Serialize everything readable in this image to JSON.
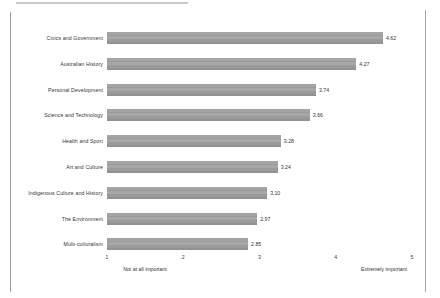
{
  "chart_data": {
    "type": "bar",
    "orientation": "horizontal",
    "title": "",
    "xlabel": "",
    "ylabel": "",
    "xlim": [
      1,
      5
    ],
    "grid": false,
    "legend": null,
    "bar_color": "#9a9a9a",
    "categories": [
      "Civics and Government",
      "Australian History",
      "Personal Development",
      "Science and Technology",
      "Health and Sport",
      "Art and Culture",
      "Indigenous Culture and History",
      "The Environment",
      "Multi-culturalism"
    ],
    "values": [
      4.62,
      4.27,
      3.74,
      3.66,
      3.28,
      3.24,
      3.1,
      2.97,
      2.85
    ],
    "value_labels": [
      "4.62",
      "4.27",
      "3.74",
      "3.66",
      "3.28",
      "3.24",
      "3.10",
      "2.97",
      "2.85"
    ],
    "xticks": [
      1,
      2,
      3,
      4,
      5
    ],
    "xtick_labels": [
      "1",
      "2",
      "3",
      "4",
      "5"
    ],
    "axis_captions": {
      "left": "Not at all important",
      "right": "Extremely important"
    }
  }
}
